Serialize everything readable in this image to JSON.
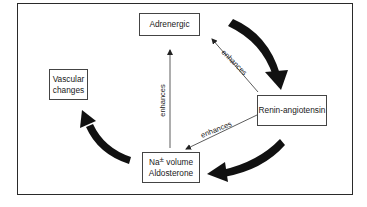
{
  "diagram": {
    "type": "cycle-flow",
    "nodes": [
      {
        "id": "adrenergic",
        "label": "Adrenergic"
      },
      {
        "id": "renin",
        "label": "Renin-angiotensin"
      },
      {
        "id": "sodium",
        "line1_prefix": "Na",
        "line1_symbol": "±",
        "line1_suffix": "volume",
        "line2": "Aldosterone"
      },
      {
        "id": "vascular",
        "line1": "Vascular",
        "line2": "changes"
      }
    ],
    "edges": [
      {
        "from": "adrenergic",
        "to": "renin",
        "style": "thick-curved",
        "label": ""
      },
      {
        "from": "renin",
        "to": "sodium",
        "style": "thick-curved",
        "label": ""
      },
      {
        "from": "sodium",
        "to": "vascular",
        "style": "thick-curved",
        "label": ""
      },
      {
        "from": "renin",
        "to": "adrenergic",
        "style": "thin",
        "label": "enhances"
      },
      {
        "from": "renin",
        "to": "sodium",
        "style": "thin",
        "label": "enhances"
      },
      {
        "from": "sodium",
        "to": "adrenergic",
        "style": "thin",
        "label": "enhances"
      }
    ],
    "colors": {
      "ink": "#1a1a1a",
      "frame": "#2a2a2a",
      "background": "#ffffff"
    }
  }
}
